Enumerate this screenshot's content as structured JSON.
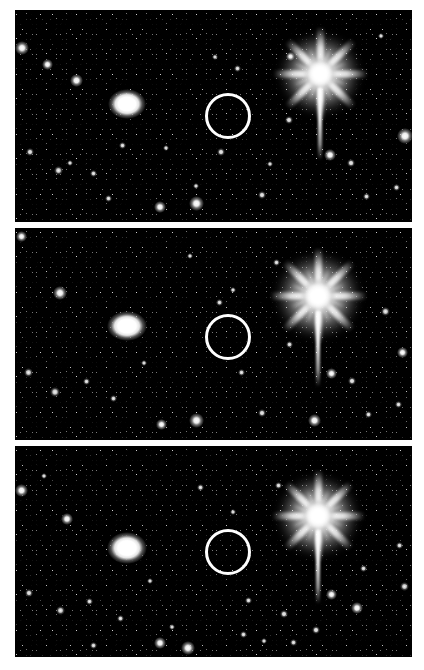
{
  "figure": {
    "canvas": {
      "width": 424,
      "height": 670
    },
    "background_color": "#ffffff",
    "sky_color": "#3b3b3b",
    "marker_color": "#ffffff",
    "star_color": "#ffffff",
    "panel_count": 3
  },
  "panels": [
    {
      "id": "panel-epoch-1",
      "label": "Epoch 1 (top)",
      "x": 15,
      "y": 10,
      "width": 397,
      "height": 212,
      "marker": {
        "cx": 228,
        "cy": 116,
        "r": 23,
        "stroke_width": 3
      },
      "bright_star": {
        "cx": 320,
        "cy": 74,
        "core_size": 40,
        "spike_len": 94,
        "vspike_len": 72
      },
      "galaxy_blob": {
        "cx": 127,
        "cy": 104,
        "rx": 19,
        "ry": 15
      },
      "stars": [
        {
          "x": 22,
          "y": 48,
          "s": 14,
          "k": "soft"
        },
        {
          "x": 47,
          "y": 64,
          "s": 11,
          "k": "soft"
        },
        {
          "x": 76,
          "y": 80,
          "s": 13,
          "k": "soft"
        },
        {
          "x": 30,
          "y": 152,
          "s": 8,
          "k": "faint"
        },
        {
          "x": 58,
          "y": 170,
          "s": 9,
          "k": "faint"
        },
        {
          "x": 93,
          "y": 173,
          "s": 7,
          "k": "faint"
        },
        {
          "x": 70,
          "y": 163,
          "s": 6,
          "k": "faint"
        },
        {
          "x": 122,
          "y": 145,
          "s": 7,
          "k": "faint"
        },
        {
          "x": 108,
          "y": 198,
          "s": 7,
          "k": "faint"
        },
        {
          "x": 166,
          "y": 148,
          "s": 6,
          "k": "faint"
        },
        {
          "x": 160,
          "y": 207,
          "s": 12,
          "k": "soft"
        },
        {
          "x": 196,
          "y": 203,
          "s": 15,
          "k": "soft"
        },
        {
          "x": 196,
          "y": 186,
          "s": 6,
          "k": "faint"
        },
        {
          "x": 237,
          "y": 68,
          "s": 7,
          "k": "faint"
        },
        {
          "x": 215,
          "y": 57,
          "s": 6,
          "k": "faint"
        },
        {
          "x": 221,
          "y": 152,
          "s": 8,
          "k": "faint"
        },
        {
          "x": 262,
          "y": 195,
          "s": 8,
          "k": "faint"
        },
        {
          "x": 270,
          "y": 164,
          "s": 6,
          "k": "faint"
        },
        {
          "x": 290,
          "y": 56,
          "s": 9,
          "k": "soft"
        },
        {
          "x": 289,
          "y": 120,
          "s": 8,
          "k": "faint"
        },
        {
          "x": 330,
          "y": 155,
          "s": 12,
          "k": "soft"
        },
        {
          "x": 351,
          "y": 163,
          "s": 8,
          "k": "faint"
        },
        {
          "x": 405,
          "y": 136,
          "s": 16,
          "k": "soft"
        },
        {
          "x": 366,
          "y": 196,
          "s": 7,
          "k": "faint"
        },
        {
          "x": 396,
          "y": 187,
          "s": 7,
          "k": "faint"
        },
        {
          "x": 381,
          "y": 36,
          "s": 6,
          "k": "faint"
        }
      ]
    },
    {
      "id": "panel-epoch-2",
      "label": "Epoch 2 (middle)",
      "x": 15,
      "y": 228,
      "width": 397,
      "height": 212,
      "marker": {
        "cx": 228,
        "cy": 337,
        "r": 23,
        "stroke_width": 3
      },
      "bright_star": {
        "cx": 318,
        "cy": 296,
        "core_size": 42,
        "spike_len": 96,
        "vspike_len": 76
      },
      "galaxy_blob": {
        "cx": 127,
        "cy": 326,
        "rx": 20,
        "ry": 15
      },
      "stars": [
        {
          "x": 21,
          "y": 236,
          "s": 11,
          "k": "soft"
        },
        {
          "x": 60,
          "y": 293,
          "s": 14,
          "k": "soft"
        },
        {
          "x": 28,
          "y": 372,
          "s": 9,
          "k": "faint"
        },
        {
          "x": 55,
          "y": 392,
          "s": 10,
          "k": "faint"
        },
        {
          "x": 86,
          "y": 381,
          "s": 7,
          "k": "faint"
        },
        {
          "x": 113,
          "y": 398,
          "s": 7,
          "k": "faint"
        },
        {
          "x": 144,
          "y": 363,
          "s": 6,
          "k": "faint"
        },
        {
          "x": 161,
          "y": 424,
          "s": 11,
          "k": "soft"
        },
        {
          "x": 196,
          "y": 420,
          "s": 15,
          "k": "soft"
        },
        {
          "x": 190,
          "y": 256,
          "s": 6,
          "k": "faint"
        },
        {
          "x": 219,
          "y": 302,
          "s": 7,
          "k": "faint"
        },
        {
          "x": 233,
          "y": 290,
          "s": 6,
          "k": "faint"
        },
        {
          "x": 241,
          "y": 372,
          "s": 7,
          "k": "faint"
        },
        {
          "x": 262,
          "y": 413,
          "s": 8,
          "k": "faint"
        },
        {
          "x": 276,
          "y": 262,
          "s": 7,
          "k": "faint"
        },
        {
          "x": 289,
          "y": 344,
          "s": 7,
          "k": "faint"
        },
        {
          "x": 314,
          "y": 420,
          "s": 13,
          "k": "soft"
        },
        {
          "x": 331,
          "y": 373,
          "s": 11,
          "k": "soft"
        },
        {
          "x": 352,
          "y": 381,
          "s": 8,
          "k": "faint"
        },
        {
          "x": 385,
          "y": 311,
          "s": 9,
          "k": "faint"
        },
        {
          "x": 402,
          "y": 352,
          "s": 11,
          "k": "soft"
        },
        {
          "x": 398,
          "y": 404,
          "s": 7,
          "k": "faint"
        },
        {
          "x": 368,
          "y": 414,
          "s": 7,
          "k": "faint"
        }
      ]
    },
    {
      "id": "panel-epoch-3",
      "label": "Epoch 3 (bottom)",
      "x": 15,
      "y": 446,
      "width": 397,
      "height": 211,
      "marker": {
        "cx": 228,
        "cy": 552,
        "r": 23,
        "stroke_width": 3
      },
      "bright_star": {
        "cx": 318,
        "cy": 516,
        "core_size": 40,
        "spike_len": 92,
        "vspike_len": 74
      },
      "galaxy_blob": {
        "cx": 127,
        "cy": 548,
        "rx": 20,
        "ry": 16
      },
      "stars": [
        {
          "x": 21,
          "y": 490,
          "s": 13,
          "k": "soft"
        },
        {
          "x": 67,
          "y": 519,
          "s": 12,
          "k": "soft"
        },
        {
          "x": 44,
          "y": 476,
          "s": 6,
          "k": "faint"
        },
        {
          "x": 29,
          "y": 593,
          "s": 8,
          "k": "faint"
        },
        {
          "x": 60,
          "y": 610,
          "s": 9,
          "k": "faint"
        },
        {
          "x": 89,
          "y": 601,
          "s": 7,
          "k": "faint"
        },
        {
          "x": 120,
          "y": 618,
          "s": 7,
          "k": "faint"
        },
        {
          "x": 93,
          "y": 645,
          "s": 7,
          "k": "faint"
        },
        {
          "x": 160,
          "y": 643,
          "s": 12,
          "k": "soft"
        },
        {
          "x": 188,
          "y": 648,
          "s": 14,
          "k": "soft"
        },
        {
          "x": 150,
          "y": 581,
          "s": 6,
          "k": "faint"
        },
        {
          "x": 172,
          "y": 627,
          "s": 6,
          "k": "faint"
        },
        {
          "x": 200,
          "y": 487,
          "s": 7,
          "k": "faint"
        },
        {
          "x": 233,
          "y": 512,
          "s": 6,
          "k": "faint"
        },
        {
          "x": 248,
          "y": 600,
          "s": 7,
          "k": "faint"
        },
        {
          "x": 243,
          "y": 634,
          "s": 7,
          "k": "faint"
        },
        {
          "x": 264,
          "y": 641,
          "s": 6,
          "k": "faint"
        },
        {
          "x": 278,
          "y": 485,
          "s": 7,
          "k": "faint"
        },
        {
          "x": 284,
          "y": 614,
          "s": 8,
          "k": "faint"
        },
        {
          "x": 293,
          "y": 642,
          "s": 7,
          "k": "faint"
        },
        {
          "x": 331,
          "y": 594,
          "s": 11,
          "k": "soft"
        },
        {
          "x": 316,
          "y": 630,
          "s": 8,
          "k": "faint"
        },
        {
          "x": 357,
          "y": 608,
          "s": 12,
          "k": "soft"
        },
        {
          "x": 363,
          "y": 568,
          "s": 7,
          "k": "faint"
        },
        {
          "x": 404,
          "y": 586,
          "s": 9,
          "k": "faint"
        },
        {
          "x": 399,
          "y": 545,
          "s": 7,
          "k": "faint"
        }
      ]
    }
  ]
}
